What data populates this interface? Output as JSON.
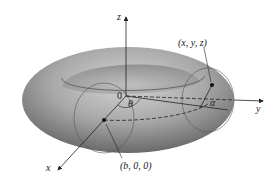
{
  "figure": {
    "labels": {
      "z_axis": "z",
      "y_axis": "y",
      "x_axis": "x",
      "origin": "0",
      "point_xyz": "(x, y, z)",
      "point_b": "(b, 0, 0)",
      "angle_theta": "θ",
      "angle_alpha": "α"
    },
    "colors": {
      "torus_light": "#b9b9b9",
      "torus_dark": "#6e6e6e",
      "line": "#333333"
    }
  }
}
